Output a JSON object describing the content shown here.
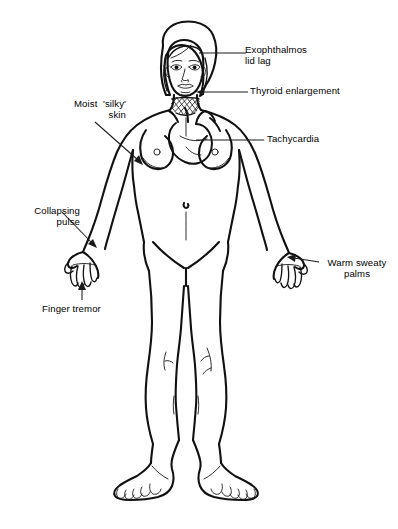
{
  "diagram": {
    "style": "black-and-white-line-drawing",
    "stroke_color": "#111111",
    "background_color": "#ffffff",
    "labels": [
      {
        "id": "exophthalmos",
        "text_line1": "Exophthalmos",
        "text_line2": "lid lag",
        "target": "eyes",
        "leader": "horizontal-line",
        "align": "left"
      },
      {
        "id": "thyroid",
        "text_line1": "Thyroid enlargement",
        "text_line2": "",
        "target": "neck",
        "leader": "horizontal-line-with-arrow",
        "align": "left"
      },
      {
        "id": "tachycardia",
        "text_line1": "Tachycardia",
        "text_line2": "",
        "target": "heart",
        "leader": "horizontal-line",
        "align": "left"
      },
      {
        "id": "moist-skin",
        "text_line1": "Moist  'silky'",
        "text_line2": "skin",
        "target": "left-upper-arm",
        "leader": "diagonal-line-with-arrow",
        "align": "right"
      },
      {
        "id": "collapsing-pulse",
        "text_line1": "Collapsing",
        "text_line2": "pulse",
        "target": "left-wrist",
        "leader": "diagonal-line-with-arrow",
        "align": "right"
      },
      {
        "id": "finger-tremor",
        "text_line1": "Finger tremor",
        "text_line2": "",
        "target": "left-hand-fingers",
        "leader": "vertical-line-with-arrow",
        "align": "left"
      },
      {
        "id": "warm-sweaty-palms",
        "text_line1": "Warm sweaty",
        "text_line2": "palms",
        "target": "right-palm",
        "leader": "horizontal-line-with-arrow",
        "align": "center"
      }
    ]
  }
}
